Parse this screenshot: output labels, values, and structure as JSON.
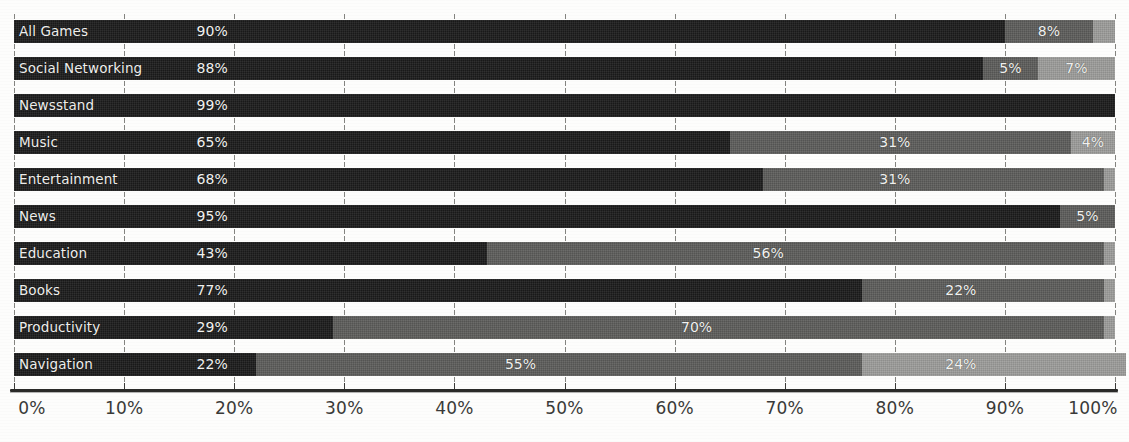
{
  "chart_data": {
    "type": "bar",
    "orientation": "horizontal",
    "stacked": true,
    "title": "",
    "subtitle": "",
    "xlabel": "",
    "ylabel": "",
    "xlim": [
      0,
      100
    ],
    "grid": true,
    "legend_position": "none",
    "value_suffix": "%",
    "x_tick_labels": [
      "0%",
      "10%",
      "20%",
      "30%",
      "40%",
      "50%",
      "60%",
      "70%",
      "80%",
      "90%",
      "100%"
    ],
    "x_ticks": [
      0,
      10,
      20,
      30,
      40,
      50,
      60,
      70,
      80,
      90,
      100
    ],
    "categories": [
      "All Games",
      "Social Networking",
      "Newsstand",
      "Music",
      "Entertainment",
      "News",
      "Education",
      "Books",
      "Productivity",
      "Navigation"
    ],
    "series": [
      {
        "name": "segment-1",
        "color": "#1b1b1b",
        "values": [
          90,
          88,
          99,
          65,
          68,
          95,
          43,
          77,
          29,
          22
        ]
      },
      {
        "name": "segment-2",
        "color": "#5d5d5b",
        "values": [
          8,
          5,
          1,
          31,
          31,
          5,
          56,
          22,
          70,
          55
        ]
      },
      {
        "name": "segment-3",
        "color": "#9d9d9b",
        "values": [
          2,
          7,
          0,
          4,
          1,
          0,
          1,
          1,
          1,
          24
        ]
      }
    ],
    "rows": [
      {
        "category": "All Games",
        "segments": [
          {
            "value": 90,
            "label": "90%",
            "shade": "dark",
            "label_shown": true,
            "label_at": 18
          },
          {
            "value": 8,
            "label": "8%",
            "shade": "mid",
            "label_shown": true,
            "label_at": 94
          },
          {
            "value": 2,
            "label": "",
            "shade": "light",
            "label_shown": false,
            "label_at": 99
          }
        ]
      },
      {
        "category": "Social Networking",
        "segments": [
          {
            "value": 88,
            "label": "88%",
            "shade": "dark",
            "label_shown": true,
            "label_at": 18
          },
          {
            "value": 5,
            "label": "5%",
            "shade": "mid",
            "label_shown": true,
            "label_at": 90.5
          },
          {
            "value": 7,
            "label": "7%",
            "shade": "light",
            "label_shown": true,
            "label_at": 96.5
          }
        ]
      },
      {
        "category": "Newsstand",
        "segments": [
          {
            "value": 99,
            "label": "99%",
            "shade": "dark",
            "label_shown": true,
            "label_at": 18
          },
          {
            "value": 1,
            "label": "",
            "shade": "dark",
            "label_shown": false,
            "label_at": 99.5
          },
          {
            "value": 0,
            "label": "",
            "shade": "light",
            "label_shown": false,
            "label_at": 100
          }
        ]
      },
      {
        "category": "Music",
        "segments": [
          {
            "value": 65,
            "label": "65%",
            "shade": "dark",
            "label_shown": true,
            "label_at": 18
          },
          {
            "value": 31,
            "label": "31%",
            "shade": "mid",
            "label_shown": true,
            "label_at": 80
          },
          {
            "value": 4,
            "label": "4%",
            "shade": "light",
            "label_shown": true,
            "label_at": 98
          }
        ]
      },
      {
        "category": "Entertainment",
        "segments": [
          {
            "value": 68,
            "label": "68%",
            "shade": "dark",
            "label_shown": true,
            "label_at": 18
          },
          {
            "value": 31,
            "label": "31%",
            "shade": "mid",
            "label_shown": true,
            "label_at": 80
          },
          {
            "value": 1,
            "label": "",
            "shade": "light",
            "label_shown": false,
            "label_at": 99.5
          }
        ]
      },
      {
        "category": "News",
        "segments": [
          {
            "value": 95,
            "label": "95%",
            "shade": "dark",
            "label_shown": true,
            "label_at": 18
          },
          {
            "value": 5,
            "label": "5%",
            "shade": "mid",
            "label_shown": true,
            "label_at": 97.5
          },
          {
            "value": 0,
            "label": "",
            "shade": "light",
            "label_shown": false,
            "label_at": 100
          }
        ]
      },
      {
        "category": "Education",
        "segments": [
          {
            "value": 43,
            "label": "43%",
            "shade": "dark",
            "label_shown": true,
            "label_at": 18
          },
          {
            "value": 56,
            "label": "56%",
            "shade": "mid",
            "label_shown": true,
            "label_at": 68.5
          },
          {
            "value": 1,
            "label": "",
            "shade": "light",
            "label_shown": false,
            "label_at": 99.5
          }
        ]
      },
      {
        "category": "Books",
        "segments": [
          {
            "value": 77,
            "label": "77%",
            "shade": "dark",
            "label_shown": true,
            "label_at": 18
          },
          {
            "value": 22,
            "label": "22%",
            "shade": "mid",
            "label_shown": true,
            "label_at": 86
          },
          {
            "value": 1,
            "label": "",
            "shade": "light",
            "label_shown": false,
            "label_at": 99.5
          }
        ]
      },
      {
        "category": "Productivity",
        "segments": [
          {
            "value": 29,
            "label": "29%",
            "shade": "dark",
            "label_shown": true,
            "label_at": 18
          },
          {
            "value": 70,
            "label": "70%",
            "shade": "mid",
            "label_shown": true,
            "label_at": 62
          },
          {
            "value": 1,
            "label": "",
            "shade": "light",
            "label_shown": false,
            "label_at": 99.5
          }
        ]
      },
      {
        "category": "Navigation",
        "segments": [
          {
            "value": 22,
            "label": "22%",
            "shade": "dark",
            "label_shown": true,
            "label_at": 18
          },
          {
            "value": 55,
            "label": "55%",
            "shade": "mid",
            "label_shown": true,
            "label_at": 46
          },
          {
            "value": 24,
            "label": "24%",
            "shade": "light",
            "label_shown": true,
            "label_at": 86
          }
        ]
      }
    ]
  },
  "style": {
    "background": "#fdfdfc",
    "dark": "#1b1b1b",
    "mid": "#5d5d5b",
    "light": "#9d9d9b",
    "axis": "#2a2a28",
    "grid": "#6e6e6a",
    "label_text": "#efefed",
    "tick_text": "#3a3a38"
  }
}
